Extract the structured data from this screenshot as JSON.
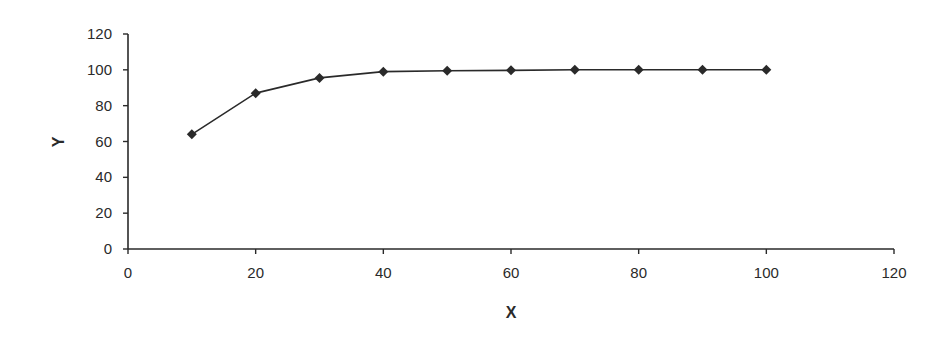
{
  "chart_data": {
    "type": "line",
    "title": "",
    "xlabel": "X",
    "ylabel": "Y",
    "xlim": [
      0,
      120
    ],
    "ylim": [
      0,
      120
    ],
    "xticks": [
      0,
      20,
      40,
      60,
      80,
      100,
      120
    ],
    "yticks": [
      0,
      20,
      40,
      60,
      80,
      100,
      120
    ],
    "grid": false,
    "legend": null,
    "marker": "diamond",
    "series": [
      {
        "name": "Y",
        "x": [
          10,
          20,
          30,
          40,
          50,
          60,
          70,
          80,
          90,
          100
        ],
        "values": [
          64,
          87,
          95.5,
          99,
          99.5,
          99.7,
          100,
          100,
          100,
          100
        ]
      }
    ]
  },
  "colors": {
    "line": "#2a2a2a",
    "axis": "#2a2a2a",
    "text": "#2a2a2a"
  }
}
